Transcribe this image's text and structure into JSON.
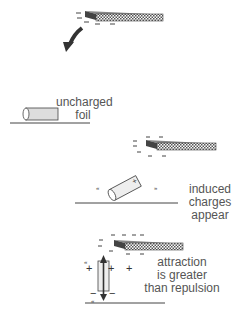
{
  "diagram": {
    "colors": {
      "ink": "#333333",
      "label": "#555555",
      "rod_hatch": "#666666",
      "foil_fill": "#dddddd"
    },
    "stages": [
      {
        "id": "charged-rod",
        "label": ""
      },
      {
        "id": "uncharged-foil",
        "label_lines": [
          "uncharged",
          "foil"
        ]
      },
      {
        "id": "induced-charges",
        "label_lines": [
          "induced",
          "charges",
          "appear"
        ]
      },
      {
        "id": "attraction",
        "label_lines": [
          "attraction",
          "is greater",
          "than repulsion"
        ]
      }
    ],
    "symbols": {
      "minus": "−",
      "plus": "+"
    }
  }
}
